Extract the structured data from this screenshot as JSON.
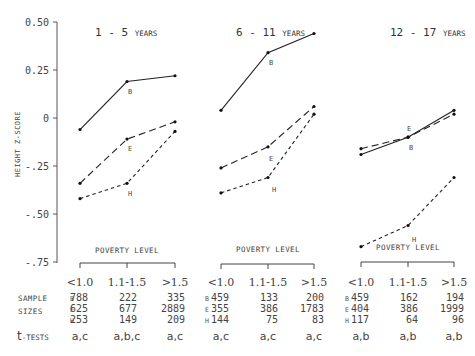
{
  "chart_data": {
    "type": "line",
    "ylabel": "HEIGHT Z-SCORE",
    "ylim": [
      -0.75,
      0.5
    ],
    "yticks": [
      0.5,
      0.25,
      0,
      -0.25,
      -0.5,
      -0.75
    ],
    "ytick_labels": [
      "0.50",
      "0.25",
      "0",
      "-.25",
      "-.50",
      "-.75"
    ],
    "xlabel": "POVERTY LEVEL",
    "categories": [
      "<1.0",
      "1.1-1.5",
      ">1.5"
    ],
    "grid": false,
    "panels": [
      {
        "title_main": "1 - 5",
        "title_small": "YEARS",
        "series": [
          {
            "name": "B",
            "style": "solid",
            "values": [
              -0.06,
              0.19,
              0.22
            ]
          },
          {
            "name": "E",
            "style": "long-dash",
            "values": [
              -0.34,
              -0.11,
              -0.02
            ]
          },
          {
            "name": "H",
            "style": "short-dash",
            "values": [
              -0.42,
              -0.34,
              -0.07
            ]
          }
        ],
        "sample_sizes": {
          "B": [
            "788",
            "222",
            "335"
          ],
          "E": [
            "625",
            "677",
            "2889"
          ],
          "H": [
            "253",
            "149",
            "209"
          ]
        },
        "t_tests": [
          "a,c",
          "a,b,c",
          "a,c"
        ]
      },
      {
        "title_main": "6 - 11",
        "title_small": "YEARS",
        "series": [
          {
            "name": "B",
            "style": "solid",
            "values": [
              0.04,
              0.34,
              0.44
            ]
          },
          {
            "name": "E",
            "style": "long-dash",
            "values": [
              -0.26,
              -0.15,
              0.06
            ]
          },
          {
            "name": "H",
            "style": "short-dash",
            "values": [
              -0.39,
              -0.31,
              0.02
            ]
          }
        ],
        "sample_sizes": {
          "B": [
            "459",
            "133",
            "200"
          ],
          "E": [
            "355",
            "386",
            "1783"
          ],
          "H": [
            "144",
            "75",
            "83"
          ]
        },
        "t_tests": [
          "a,c",
          "a,c",
          "a,c"
        ]
      },
      {
        "title_main": "12 - 17",
        "title_small": "YEARS",
        "series": [
          {
            "name": "B",
            "style": "solid",
            "values": [
              -0.19,
              -0.1,
              0.04
            ]
          },
          {
            "name": "E",
            "style": "long-dash",
            "values": [
              -0.16,
              -0.1,
              0.02
            ]
          },
          {
            "name": "H",
            "style": "short-dash",
            "values": [
              -0.67,
              -0.56,
              -0.31
            ]
          }
        ],
        "sample_sizes": {
          "B": [
            "459",
            "162",
            "194"
          ],
          "E": [
            "404",
            "386",
            "1999"
          ],
          "H": [
            "117",
            "64",
            "96"
          ]
        },
        "t_tests": [
          "a,b",
          "a,b",
          "a,b"
        ]
      }
    ]
  },
  "table": {
    "sample_label_1": "SAMPLE",
    "sample_label_2": "SIZES",
    "row_keys": [
      "B",
      "E",
      "H"
    ],
    "ttest_label_main": "t",
    "ttest_label_small": "-TESTS"
  }
}
